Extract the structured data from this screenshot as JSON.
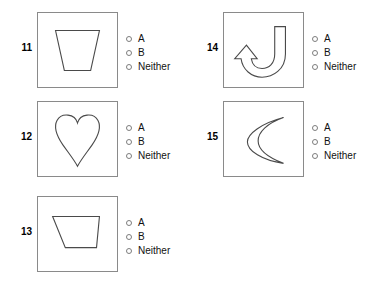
{
  "worksheet": {
    "title": "Shape identification multiple choice items",
    "background_color": "#ffffff",
    "box_border_color": "#8a8a8a",
    "shape_stroke_color": "#4a4a4a",
    "radio_border_color": "#7d7d7d"
  },
  "options": {
    "a_label": "A",
    "b_label": "B",
    "neither_label": "Neither"
  },
  "items": [
    {
      "number": "11",
      "shape_name": "trapezoid",
      "column": "left",
      "options": [
        "A",
        "B",
        "Neither"
      ]
    },
    {
      "number": "12",
      "shape_name": "heart",
      "column": "left",
      "options": [
        "A",
        "B",
        "Neither"
      ]
    },
    {
      "number": "13",
      "shape_name": "irregular-quadrilateral",
      "column": "left",
      "options": [
        "A",
        "B",
        "Neither"
      ]
    },
    {
      "number": "14",
      "shape_name": "j-hook-arrow",
      "column": "right",
      "options": [
        "A",
        "B",
        "Neither"
      ]
    },
    {
      "number": "15",
      "shape_name": "crescent",
      "column": "right",
      "options": [
        "A",
        "B",
        "Neither"
      ]
    }
  ]
}
